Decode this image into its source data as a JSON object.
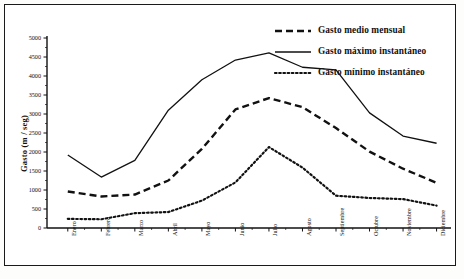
{
  "chart_data": {
    "type": "line",
    "title": "",
    "xlabel": "",
    "ylabel": "Gasto (m / seg)",
    "ylim": [
      0,
      5000
    ],
    "yticks": [
      0,
      500,
      1000,
      1500,
      2000,
      2500,
      3000,
      3500,
      4000,
      4500,
      5000
    ],
    "ytick_labels": [
      "0",
      "500",
      "1000",
      "1500",
      "2000",
      "2500",
      "3000",
      "3500",
      "4000",
      "4500",
      "5000"
    ],
    "grid": false,
    "legend_position": "top-right",
    "categories": [
      "Enero",
      "Febrero",
      "Marzo",
      "Abril",
      "Mayo",
      "Junio",
      "Julio",
      "Agosto",
      "Septiembre",
      "Octubre",
      "Noviembre",
      "Diciembre"
    ],
    "series": [
      {
        "name": "Gasto medio mensual",
        "style": "dashed",
        "color": "#111111",
        "values": [
          960,
          830,
          880,
          1250,
          2080,
          3120,
          3420,
          3180,
          2630,
          2010,
          1560,
          1190
        ]
      },
      {
        "name": "Gasto máximo instantáneo",
        "style": "solid",
        "color": "#111111",
        "values": [
          1920,
          1340,
          1780,
          3100,
          3900,
          4420,
          4610,
          4230,
          4160,
          3030,
          2420,
          2230
        ]
      },
      {
        "name": "Gasto mínimo instantáneo",
        "style": "dotted",
        "color": "#111111",
        "values": [
          240,
          230,
          390,
          420,
          720,
          1200,
          2130,
          1590,
          850,
          790,
          760,
          590
        ]
      }
    ]
  },
  "legend": {
    "items": [
      {
        "label": "Gasto medio mensual"
      },
      {
        "label": "Gasto máximo instantáneo"
      },
      {
        "label": "Gasto mínimo instantáneo"
      }
    ]
  }
}
